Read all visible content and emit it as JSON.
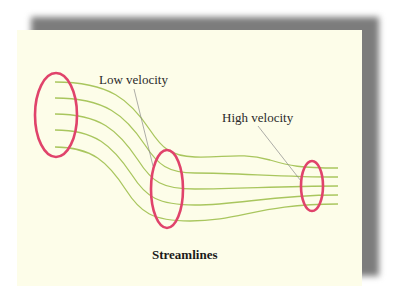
{
  "figure": {
    "caption": "Streamlines",
    "labels": {
      "low_velocity": "Low velocity",
      "high_velocity": "High velocity"
    },
    "colors": {
      "panel_background": "#fdfde9",
      "shadow": "#7c7c7c",
      "streamline": "#a9c65e",
      "cross_section_ring": "#e0436b",
      "leader_line": "#8a8a8a",
      "text": "#2a2a2a"
    },
    "cross_sections": [
      {
        "name": "wide-inlet",
        "cx": 56,
        "cy": 115,
        "rx": 21,
        "ry": 42
      },
      {
        "name": "middle",
        "cx": 167,
        "cy": 189,
        "rx": 16,
        "ry": 39
      },
      {
        "name": "narrow-outlet",
        "cx": 312,
        "cy": 186,
        "rx": 11,
        "ry": 25
      }
    ],
    "streamline_count": 5
  }
}
